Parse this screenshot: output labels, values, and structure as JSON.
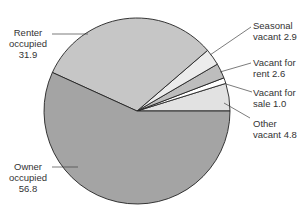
{
  "chart_data": {
    "type": "pie",
    "title": "",
    "unit": "percent",
    "start_angle_deg": 0,
    "direction": "counterclockwise",
    "slices": [
      {
        "name": "Other vacant",
        "value": 4.8,
        "color": "#e2e2e2",
        "label_lines": [
          "Other",
          "vacant 4.8"
        ]
      },
      {
        "name": "Vacant for sale",
        "value": 1.0,
        "color": "#ffffff",
        "label_lines": [
          "Vacant for",
          "sale 1.0"
        ]
      },
      {
        "name": "Vacant for rent",
        "value": 2.6,
        "color": "#bdbdbd",
        "label_lines": [
          "Vacant for",
          "rent 2.6"
        ]
      },
      {
        "name": "Seasonal vacant",
        "value": 2.9,
        "color": "#ececec",
        "label_lines": [
          "Seasonal",
          "vacant 2.9"
        ]
      },
      {
        "name": "Renter occupied",
        "value": 31.9,
        "color": "#c6c6c6",
        "label_lines": [
          "Renter",
          "occupied",
          "31.9"
        ]
      },
      {
        "name": "Owner occupied",
        "value": 56.8,
        "color": "#a4a4a4",
        "label_lines": [
          "Owner",
          "occupied",
          "56.8"
        ]
      }
    ],
    "legend": "none (callout labels)"
  },
  "labels": {
    "renter": {
      "l1": "Renter",
      "l2": "occupied",
      "l3": "31.9"
    },
    "owner": {
      "l1": "Owner",
      "l2": "occupied",
      "l3": "56.8"
    },
    "seasonal": {
      "l1": "Seasonal",
      "l2": "vacant 2.9"
    },
    "rent": {
      "l1": "Vacant for",
      "l2": "rent 2.6"
    },
    "sale": {
      "l1": "Vacant for",
      "l2": "sale 1.0"
    },
    "other": {
      "l1": "Other",
      "l2": "vacant 4.8"
    }
  }
}
